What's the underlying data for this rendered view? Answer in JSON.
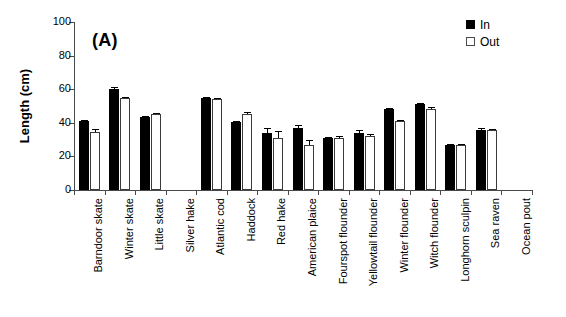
{
  "panel_label": "(A)",
  "legend": {
    "position": "top-right",
    "entries": [
      {
        "label": "In",
        "style": "filled",
        "color": "#000000"
      },
      {
        "label": "Out",
        "style": "open",
        "color": "#ffffff"
      }
    ]
  },
  "axes": {
    "ylabel": "Length (cm)",
    "yticks": [
      0,
      20,
      40,
      60,
      80,
      100
    ],
    "ytick_labels": [
      "0",
      "20",
      "40",
      "60",
      "80",
      "100"
    ],
    "ylim": [
      0,
      100
    ],
    "xlabel": ""
  },
  "chart_data": {
    "type": "bar",
    "title": "(A)",
    "xlabel": "",
    "ylabel": "Length (cm)",
    "ylim": [
      0,
      100
    ],
    "grid": false,
    "legend_position": "top-right",
    "categories": [
      "Barndoor skate",
      "Winter skate",
      "Little skate",
      "Silver hake",
      "Atlantic cod",
      "Haddock",
      "Red hake",
      "American plaice",
      "Fourspot flounder",
      "Yellowtail flounder",
      "Winter flounder",
      "Witch flounder",
      "Longhorn sculpin",
      "Sea raven",
      "Ocean pout"
    ],
    "series": [
      {
        "name": "In",
        "values": [
          41,
          60,
          43.5,
          null,
          54.5,
          40.5,
          34,
          37,
          31,
          34,
          48,
          51,
          26.5,
          36,
          null
        ],
        "errors": [
          0.6,
          1.5,
          0.8,
          null,
          1.0,
          0.8,
          3.0,
          1.5,
          0.8,
          1.5,
          0.8,
          1.0,
          0.6,
          0.8,
          null
        ]
      },
      {
        "name": "Out",
        "values": [
          34.5,
          54.5,
          45,
          null,
          54,
          45,
          31,
          26.5,
          31,
          32,
          41,
          48.5,
          27,
          36,
          null
        ],
        "errors": [
          2.0,
          1.0,
          0.6,
          null,
          1.0,
          1.5,
          4.0,
          3.5,
          1.0,
          1.5,
          0.5,
          0.8,
          0.6,
          0.6,
          null
        ]
      }
    ]
  }
}
